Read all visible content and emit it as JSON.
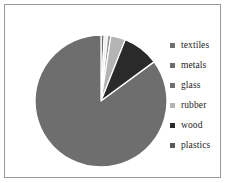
{
  "chart_data": {
    "type": "pie",
    "title": "",
    "subtitle": "",
    "xlabel": "",
    "ylabel": "",
    "legend_position": "right",
    "grid": false,
    "start_angle_deg": 0,
    "direction": "clockwise",
    "categories": [
      "textiles",
      "metals",
      "glass",
      "rubber",
      "wood",
      "plastics"
    ],
    "values": [
      0.8,
      0.8,
      0.8,
      3.6,
      8.9,
      85.1
    ],
    "value_unit": "percent",
    "angles_deg": [
      3,
      3,
      3,
      13,
      32,
      306
    ],
    "colors": [
      "#6e6e6e",
      "#e8e8e8",
      "#8f8f8f",
      "#b4b4b4",
      "#2a2a2a",
      "#6e6e6e"
    ],
    "slice_border_color": "#ffffff",
    "slices": [
      {
        "label": "textiles",
        "value": 0.8,
        "angle_deg": 3,
        "color": "#6e6e6e"
      },
      {
        "label": "metals",
        "value": 0.8,
        "angle_deg": 3,
        "color": "#e8e8e8"
      },
      {
        "label": "glass",
        "value": 0.8,
        "angle_deg": 3,
        "color": "#8f8f8f"
      },
      {
        "label": "rubber",
        "value": 3.6,
        "angle_deg": 13,
        "color": "#b4b4b4"
      },
      {
        "label": "wood",
        "value": 8.9,
        "angle_deg": 32,
        "color": "#2a2a2a"
      },
      {
        "label": "plastics",
        "value": 85.1,
        "angle_deg": 306,
        "color": "#6e6e6e"
      }
    ]
  },
  "legend": {
    "items": [
      {
        "label": "textiles",
        "swatch_color": "#6e6e6e"
      },
      {
        "label": "metals",
        "swatch_color": "#6e6e6e"
      },
      {
        "label": "glass",
        "swatch_color": "#6e6e6e"
      },
      {
        "label": "rubber",
        "swatch_color": "#b4b4b4"
      },
      {
        "label": "wood",
        "swatch_color": "#2a2a2a"
      },
      {
        "label": "plastics",
        "swatch_color": "#5a5a5a"
      }
    ]
  },
  "frame": {
    "border_color": "#9a9a9a",
    "background": "#ffffff"
  }
}
